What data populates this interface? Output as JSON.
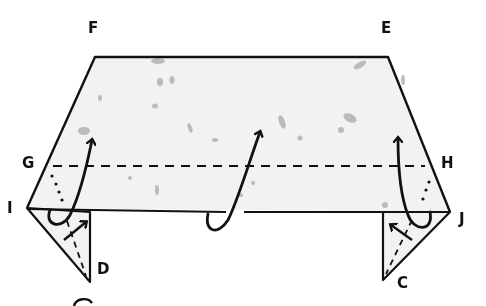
{
  "diagram": {
    "type": "origami-fold-instruction",
    "paper_color": "#f2f2f0",
    "line_color": "#111111",
    "fleck_color": "#9a9a9a",
    "labels": {
      "F": "F",
      "E": "E",
      "G": "G",
      "H": "H",
      "I": "I",
      "J": "J",
      "D": "D",
      "C": "C"
    },
    "fold_lines": [
      {
        "name": "valley-fold-G-H",
        "style": "dashed",
        "from": "G",
        "to": "H"
      },
      {
        "name": "left-flap-crease",
        "style": "dashed"
      },
      {
        "name": "right-flap-crease",
        "style": "dashed"
      }
    ],
    "arrows": [
      {
        "name": "left-fold-up-arrow",
        "direction": "up"
      },
      {
        "name": "center-fold-up-arrow",
        "direction": "up"
      },
      {
        "name": "right-fold-up-arrow",
        "direction": "up"
      },
      {
        "name": "left-flap-arrow",
        "direction": "up-right"
      },
      {
        "name": "right-flap-arrow",
        "direction": "up-left"
      }
    ]
  }
}
